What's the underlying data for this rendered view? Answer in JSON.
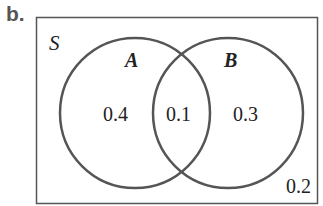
{
  "part_label": "b.",
  "universe": {
    "label": "S"
  },
  "sets": [
    {
      "name": "A"
    },
    {
      "name": "B"
    }
  ],
  "regions": {
    "a_only": "0.4",
    "a_and_b": "0.1",
    "b_only": "0.3",
    "neither": "0.2"
  },
  "colors": {
    "outline": "#555555",
    "text": "#222222"
  }
}
